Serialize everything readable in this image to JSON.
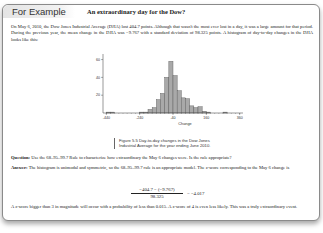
{
  "header": {
    "tag": "For Example",
    "subtitle": "An extraordinary day for the Dow?"
  },
  "intro": "On May 6, 2010, the Dow Jones Industrial Average (DJIA) lost 404.7 points. Although that wasn't the most ever lost in a day, it was a large amount for that period. During the previous year, the mean change in the DJIA was −9.767 with a standard deviation of 98.325 points. A histogram of day-to-day changes in the DJIA looks like this:",
  "figure": {
    "caption_line1": "Figure 5.5   Day-to-day changes in the Dow Jones",
    "caption_line2": "Industrial Average for the year ending June 2010."
  },
  "chart_data": {
    "type": "bar",
    "title": "",
    "xlabel": "Change",
    "ylabel": "",
    "x_ticks": [
      "-440",
      "-240",
      "-40",
      "160",
      "360"
    ],
    "y_ticks": [
      "20",
      "40",
      "60"
    ],
    "ylim": [
      0,
      65
    ],
    "bin_width": 25,
    "bin_starts": [
      -440,
      -415,
      -390,
      -365,
      -340,
      -315,
      -290,
      -265,
      -240,
      -215,
      -190,
      -165,
      -140,
      -115,
      -90,
      -65,
      -40,
      -15,
      10,
      35,
      60,
      85,
      110,
      135,
      160,
      185,
      210,
      235,
      260,
      285
    ],
    "values": [
      1,
      1,
      0,
      0,
      0,
      0,
      0,
      0,
      1,
      1,
      4,
      6,
      15,
      22,
      40,
      58,
      42,
      25,
      17,
      16,
      8,
      6,
      7,
      2,
      1,
      0,
      0,
      0,
      1,
      0
    ],
    "grid": false,
    "legend": null
  },
  "question": {
    "label": "Question:",
    "text": " Use the 68–95–99.7 Rule to characterize how extraordinary the May 6 changes were. Is the rule appropriate?"
  },
  "answer": {
    "label": "Answer:",
    "text": " The histogram is unimodal and symmetric, so the 68–95–99.7 rule is an appropriate model. The z-score corresponding to the May 6 change is"
  },
  "formula": {
    "numerator": "−404.7 − (−9.767)",
    "denominator": "98.325",
    "result": "= −4.017"
  },
  "conclusion": "A z-score bigger than 3 in magnitude will occur with a probability of less than 0.015. A z-score of 4 is even less likely. This was a truly extraordinary event."
}
